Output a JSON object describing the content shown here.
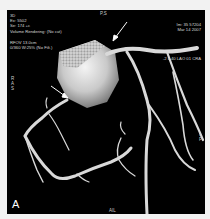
{
  "viewer": {
    "panel_label": "A",
    "top_left": {
      "lines": [
        "3D",
        "Ex: 5502",
        "Se: 174 +c",
        "Volume Rendering: (No cut)"
      ],
      "fov_lines": [
        "RFOV 13.0cm",
        "0/360 W:25% (No Filt.)"
      ]
    },
    "top_right": {
      "lines": [
        "Im: 35  57204",
        "Mar 14 2007"
      ],
      "angle": "-2 L 40 LAO 01 CRA"
    },
    "orientation": {
      "top": "P,S",
      "bottom": "AIL",
      "left": [
        "R",
        "A",
        "S"
      ],
      "right": [
        "L",
        "P"
      ]
    },
    "annotations": [
      {
        "type": "arrow",
        "target": "left-main-origin"
      },
      {
        "type": "arrow",
        "target": "right-coronary-origin"
      }
    ]
  }
}
